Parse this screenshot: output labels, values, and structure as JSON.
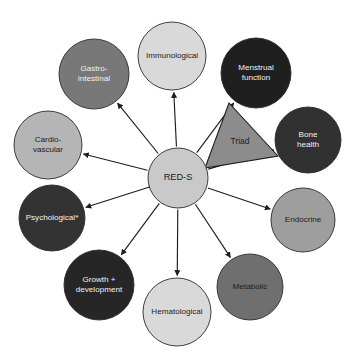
{
  "figure": {
    "caption_fragment": "",
    "width": 353,
    "height": 357,
    "background": "#ffffff"
  },
  "hub": {
    "id": "red-s",
    "label": "RED-S",
    "cx": 178,
    "cy": 178,
    "r": 30,
    "fill": "#c9c9c9",
    "text_color": "#1c1c1c"
  },
  "triad": {
    "label": "Triad",
    "fill": "#8c8c8c",
    "text_color": "#1c1c1c",
    "points": "205,168 229,103 278,156",
    "label_x": 240,
    "label_y": 142
  },
  "nodes": [
    {
      "id": "immunological",
      "label": "Immunological",
      "lines": [
        "Immunological"
      ],
      "cx": 172,
      "cy": 56,
      "r": 34,
      "fill": "#d9d9d9",
      "text_color": "#1c1c1c",
      "arrow": "single"
    },
    {
      "id": "menstrual-function",
      "label": "Menstrual function",
      "lines": [
        "Menstrual",
        "function"
      ],
      "cx": 256,
      "cy": 73,
      "r": 35,
      "fill": "#1f1f1f",
      "text_color": "#f2f2f2",
      "arrow": "single"
    },
    {
      "id": "bone-health",
      "label": "Bone health",
      "lines": [
        "Bone",
        "health"
      ],
      "cx": 308,
      "cy": 140,
      "r": 33,
      "fill": "#313131",
      "text_color": "#f2f2f2",
      "arrow": "single"
    },
    {
      "id": "endocrine",
      "label": "Endocrine",
      "lines": [
        "Endocrine"
      ],
      "cx": 303,
      "cy": 220,
      "r": 32,
      "fill": "#9e9e9e",
      "text_color": "#1c1c1c",
      "arrow": "single"
    },
    {
      "id": "metabolic",
      "label": "Metabolic",
      "lines": [
        "Metabolic"
      ],
      "cx": 250,
      "cy": 287,
      "r": 33,
      "fill": "#6f6f6f",
      "text_color": "#1c1c1c",
      "arrow": "single"
    },
    {
      "id": "hematological",
      "label": "Hematological",
      "lines": [
        "Hematological"
      ],
      "cx": 177,
      "cy": 312,
      "r": 34,
      "fill": "#d9d9d9",
      "text_color": "#1c1c1c",
      "arrow": "single"
    },
    {
      "id": "growth-development",
      "label": "Growth + development",
      "lines": [
        "Growth +",
        "development"
      ],
      "cx": 99,
      "cy": 285,
      "r": 35,
      "fill": "#262626",
      "text_color": "#f2f2f2",
      "arrow": "single"
    },
    {
      "id": "psychological",
      "label": "Psychological*",
      "lines": [
        "Psychological*"
      ],
      "cx": 52,
      "cy": 218,
      "r": 33,
      "fill": "#333333",
      "text_color": "#f2f2f2",
      "arrow": "double"
    },
    {
      "id": "cardio-vascular",
      "label": "Cardio-vascular",
      "lines": [
        "Cardio-",
        "vascular"
      ],
      "cx": 48,
      "cy": 145,
      "r": 34,
      "fill": "#b5b5b5",
      "text_color": "#1c1c1c",
      "arrow": "single"
    },
    {
      "id": "gastro-intestinal",
      "label": "Gastro-intestinal",
      "lines": [
        "Gastro-",
        "intestinal"
      ],
      "cx": 94,
      "cy": 74,
      "r": 35,
      "fill": "#787878",
      "text_color": "#f2f2f2",
      "arrow": "single"
    }
  ]
}
